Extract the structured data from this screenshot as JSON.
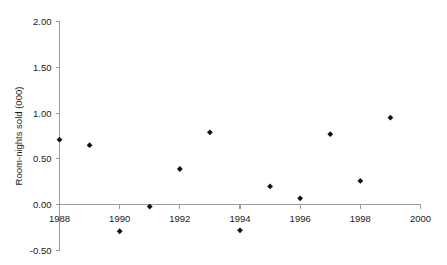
{
  "chart_data": {
    "type": "scatter",
    "title": "",
    "xlabel": "",
    "ylabel": "Room-nights sold (000)",
    "x": [
      1988,
      1989,
      1990,
      1991,
      1992,
      1993,
      1994,
      1995,
      1996,
      1997,
      1998,
      1999
    ],
    "values": [
      0.71,
      0.65,
      -0.29,
      -0.02,
      0.39,
      0.79,
      -0.28,
      0.2,
      0.07,
      0.77,
      0.26,
      0.95
    ],
    "series": [
      {
        "name": "Room-nights sold",
        "points": [
          {
            "x": 1988,
            "y": 0.71
          },
          {
            "x": 1989,
            "y": 0.65
          },
          {
            "x": 1990,
            "y": -0.29
          },
          {
            "x": 1991,
            "y": -0.02
          },
          {
            "x": 1992,
            "y": 0.39
          },
          {
            "x": 1993,
            "y": 0.79
          },
          {
            "x": 1994,
            "y": -0.28
          },
          {
            "x": 1995,
            "y": 0.2
          },
          {
            "x": 1996,
            "y": 0.07
          },
          {
            "x": 1997,
            "y": 0.77
          },
          {
            "x": 1998,
            "y": 0.26
          },
          {
            "x": 1999,
            "y": 0.95
          }
        ]
      }
    ],
    "xlim": [
      1988,
      2000
    ],
    "ylim": [
      -0.5,
      2.0
    ],
    "xticks": [
      1988,
      1990,
      1992,
      1994,
      1996,
      1998,
      2000
    ],
    "xticklabels": [
      "1988",
      "1990",
      "1992",
      "1994",
      "1996",
      "1998",
      "2000"
    ],
    "yticks": [
      -0.5,
      0.0,
      0.5,
      1.0,
      1.5,
      2.0
    ],
    "yticklabels": [
      "-0.50",
      "0.00",
      "0.50",
      "1.00",
      "1.50",
      "2.00"
    ],
    "grid": false,
    "legend": null,
    "marker_color": "#111111",
    "axis_color": "#9d9d9d",
    "background_color": "#ffffff"
  }
}
